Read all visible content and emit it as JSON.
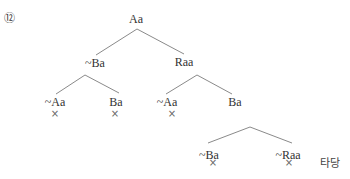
{
  "problem_number": "⑫",
  "tree": {
    "root": {
      "label": "Aa"
    },
    "level1": [
      {
        "label": "~Ba"
      },
      {
        "label": "Raa"
      }
    ],
    "level2_left": [
      {
        "label": "~Aa",
        "closed": "×"
      },
      {
        "label": "Ba",
        "closed": "×"
      }
    ],
    "level2_right": [
      {
        "label": "~Aa",
        "closed": "×"
      },
      {
        "label": "Ba"
      }
    ],
    "level3": [
      {
        "label": "~Ba",
        "closed": "×"
      },
      {
        "label": "~Raa",
        "closed": "×"
      }
    ]
  },
  "verdict": "타당",
  "colors": {
    "edge": "#8a8a8a",
    "text": "#333333",
    "mark": "#666666"
  }
}
